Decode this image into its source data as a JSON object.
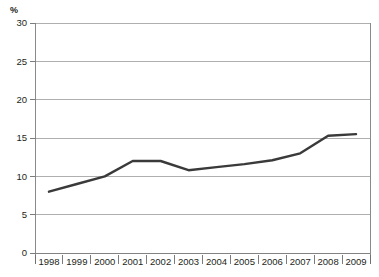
{
  "chart_data": {
    "type": "line",
    "title": "",
    "subtitle": "",
    "xlabel": "",
    "ylabel": "%",
    "unit_label": "%",
    "categories": [
      "1998",
      "1999",
      "2000",
      "2001",
      "2002",
      "2003",
      "2004",
      "2005",
      "2006",
      "2007",
      "2008",
      "2009"
    ],
    "series": [
      {
        "name": "",
        "values": [
          8.0,
          9.0,
          10.0,
          12.0,
          12.0,
          10.8,
          11.2,
          11.6,
          12.1,
          13.0,
          15.3,
          15.5
        ]
      }
    ],
    "ylim": [
      0,
      30
    ],
    "y_ticks": [
      "0",
      "5",
      "10",
      "15",
      "20",
      "25",
      "30"
    ],
    "y_tick_values": [
      0,
      5,
      10,
      15,
      20,
      25,
      30
    ],
    "grid": "horizontal",
    "legend": "none",
    "line_color": "#3a3a3a",
    "grid_color": "#9b9b9b",
    "axis_color": "#7d7d7d",
    "text_color": "#231f20",
    "background_color": "#ffffff",
    "x_tick_placement": "band-edges",
    "annotations": []
  },
  "layout": {
    "plot_left": 35,
    "plot_right": 370,
    "plot_top": 23,
    "plot_bottom": 253,
    "label_baseline_y": 265
  }
}
